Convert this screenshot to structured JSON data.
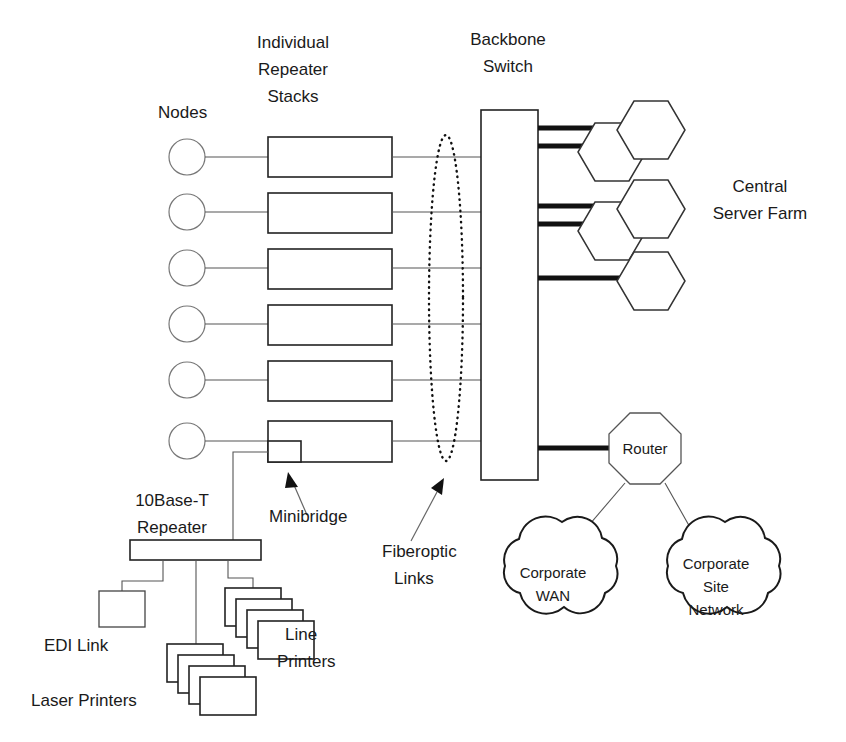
{
  "diagram": {
    "canvas": {
      "width": 846,
      "height": 742
    },
    "labels": {
      "nodes": "Nodes",
      "individual": "Individual",
      "repeater": "Repeater",
      "stacks": "Stacks",
      "backbone": "Backbone",
      "switch": "Switch",
      "central": "Central",
      "server_farm": "Server Farm",
      "fiberoptic": "Fiberoptic",
      "links": "Links",
      "minibridge": "Minibridge",
      "tenbaset": "10Base-T",
      "repeater2": "Repeater",
      "edi_link": "EDI Link",
      "laser_printers": "Laser Printers",
      "line": "Line",
      "printers": "Printers",
      "router": "Router",
      "corporate": "Corporate",
      "wan": "WAN",
      "corporate2": "Corporate",
      "site": "Site",
      "network": "Network"
    },
    "nodes": {
      "count": 6,
      "shape": "circle",
      "radius": 18,
      "x": 187,
      "y_positions": [
        157,
        212,
        268,
        324,
        380,
        441
      ]
    },
    "repeater_stacks": {
      "count": 6,
      "shape": "rectangle",
      "x": 268,
      "width": 124,
      "height": 40,
      "y_positions": [
        137,
        193,
        249,
        305,
        361,
        421
      ]
    },
    "minibridge": {
      "x": 268,
      "y": 441,
      "width": 33,
      "height": 21
    },
    "backbone_switch": {
      "x": 481,
      "y": 110,
      "width": 57,
      "height": 370
    },
    "fiberoptic_ellipse": {
      "cx": 446,
      "cy": 298,
      "rx": 17,
      "ry": 163
    },
    "server_farm": {
      "groups": [
        {
          "type": "pair",
          "back_cx": 612,
          "back_cy": 152,
          "front_cx": 651,
          "front_cy": 130
        },
        {
          "type": "pair",
          "back_cx": 612,
          "back_cy": 231,
          "front_cx": 651,
          "front_cy": 209
        },
        {
          "type": "single",
          "front_cx": 651,
          "front_cy": 281
        }
      ],
      "hex_radius": 33
    },
    "thick_links": {
      "from_x": 538,
      "segments": [
        {
          "y": 128,
          "to_x": 625
        },
        {
          "y": 146,
          "to_x": 586
        },
        {
          "y": 206,
          "to_x": 625
        },
        {
          "y": 224,
          "to_x": 586
        },
        {
          "y": 278,
          "to_x": 625
        },
        {
          "y": 448,
          "to_x": 608
        }
      ]
    },
    "router": {
      "cx": 645,
      "cy": 448,
      "radius": 36,
      "shape": "octagon"
    },
    "clouds": [
      {
        "name": "corporate-wan",
        "cx": 553,
        "cy": 584,
        "rx": 74,
        "ry": 48
      },
      {
        "name": "corporate-site-network",
        "cx": 716,
        "cy": 584,
        "rx": 74,
        "ry": 48
      }
    ],
    "tenbaset_repeater": {
      "x": 130,
      "y": 540,
      "width": 131,
      "height": 20
    },
    "edi_box": {
      "x": 99,
      "y": 591,
      "width": 46,
      "height": 36
    },
    "printer_stacks": [
      {
        "name": "laser-printers",
        "x": 167,
        "y": 644,
        "sheets": 4,
        "sheet_w": 56,
        "sheet_h": 38,
        "offset": 11
      },
      {
        "name": "line-printers",
        "x": 225,
        "y": 588,
        "sheets": 4,
        "sheet_w": 56,
        "sheet_h": 38,
        "offset": 11
      }
    ],
    "annotations": [
      {
        "name": "minibridge-arrow",
        "from_x": 305,
        "from_y": 513,
        "to_x": 291,
        "to_y": 477
      },
      {
        "name": "fiberoptic-arrow",
        "from_x": 412,
        "from_y": 540,
        "to_x": 443,
        "to_y": 481
      }
    ],
    "colors": {
      "stroke_dark": "#111111",
      "stroke_mid": "#444444",
      "stroke_light": "#777777",
      "text": "#1a1a1a",
      "background": "#ffffff"
    }
  }
}
